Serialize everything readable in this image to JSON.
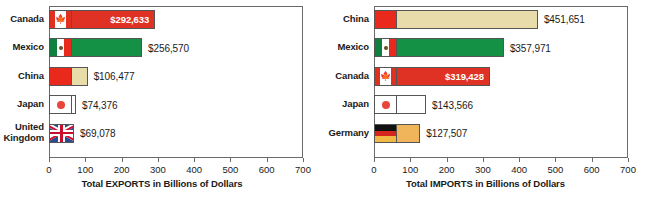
{
  "chart_data": [
    {
      "type": "bar",
      "orientation": "horizontal",
      "id": "exports",
      "title": "",
      "xlabel": "Total EXPORTS in Billions of Dollars",
      "ylabel": "",
      "xlim": [
        0,
        700
      ],
      "xticks": [
        0,
        100,
        200,
        300,
        400,
        500,
        600,
        700
      ],
      "grid": false,
      "legend": "none",
      "categories": [
        "Canada",
        "Mexico",
        "China",
        "Japan",
        "United\nKingdom"
      ],
      "values": [
        292.633,
        256.57,
        106.477,
        74.376,
        69.078
      ],
      "labels": [
        "$292,633",
        "$256,570",
        "$106,477",
        "$74,376",
        "$69,078"
      ],
      "label_position": [
        "inside",
        "outside",
        "outside",
        "outside",
        "outside"
      ]
    },
    {
      "type": "bar",
      "orientation": "horizontal",
      "id": "imports",
      "title": "",
      "xlabel": "Total IMPORTS in Billions of Dollars",
      "ylabel": "",
      "xlim": [
        0,
        700
      ],
      "xticks": [
        0,
        100,
        200,
        300,
        400,
        500,
        600,
        700
      ],
      "grid": false,
      "legend": "none",
      "categories": [
        "China",
        "Mexico",
        "Canada",
        "Japan",
        "Germany"
      ],
      "values": [
        451.651,
        357.971,
        319.428,
        143.566,
        127.507
      ],
      "labels": [
        "$451,651",
        "$357,971",
        "$319,428",
        "$143,566",
        "$127,507"
      ],
      "label_position": [
        "outside",
        "outside",
        "inside",
        "outside",
        "outside"
      ]
    }
  ],
  "exports": {
    "axis_title": "Total EXPORTS in Billions of Dollars",
    "ticks": [
      "0",
      "100",
      "200",
      "300",
      "400",
      "500",
      "600",
      "700"
    ],
    "rows": [
      {
        "country": "Canada",
        "line1": "Canada",
        "line2": "",
        "value": 292.633,
        "label": "$292,633",
        "inside": true,
        "flag": "ca",
        "fill": "#e03224"
      },
      {
        "country": "Mexico",
        "line1": "Mexico",
        "line2": "",
        "value": 256.57,
        "label": "$256,570",
        "inside": false,
        "flag": "mx",
        "fill": "#159145"
      },
      {
        "country": "China",
        "line1": "China",
        "line2": "",
        "value": 106.477,
        "label": "$106,477",
        "inside": false,
        "flag": "cn",
        "fill": "#e8dcab"
      },
      {
        "country": "Japan",
        "line1": "Japan",
        "line2": "",
        "value": 74.376,
        "label": "$74,376",
        "inside": false,
        "flag": "jp",
        "fill": "#ffffff"
      },
      {
        "country": "United Kingdom",
        "line1": "United",
        "line2": "Kingdom",
        "value": 69.078,
        "label": "$69,078",
        "inside": false,
        "flag": "uk",
        "fill": "#2a4b8d"
      }
    ]
  },
  "imports": {
    "axis_title": "Total IMPORTS in Billions of Dollars",
    "ticks": [
      "0",
      "100",
      "200",
      "300",
      "400",
      "500",
      "600",
      "700"
    ],
    "rows": [
      {
        "country": "China",
        "line1": "China",
        "line2": "",
        "value": 451.651,
        "label": "$451,651",
        "inside": false,
        "flag": "cn",
        "fill": "#e8dcab"
      },
      {
        "country": "Mexico",
        "line1": "Mexico",
        "line2": "",
        "value": 357.971,
        "label": "$357,971",
        "inside": false,
        "flag": "mx",
        "fill": "#159145"
      },
      {
        "country": "Canada",
        "line1": "Canada",
        "line2": "",
        "value": 319.428,
        "label": "$319,428",
        "inside": true,
        "flag": "ca",
        "fill": "#e03224"
      },
      {
        "country": "Japan",
        "line1": "Japan",
        "line2": "",
        "value": 143.566,
        "label": "$143,566",
        "inside": false,
        "flag": "jp",
        "fill": "#ffffff"
      },
      {
        "country": "Germany",
        "line1": "Germany",
        "line2": "",
        "value": 127.507,
        "label": "$127,507",
        "inside": false,
        "flag": "de",
        "fill": "#f0b45a"
      }
    ]
  },
  "colors": {
    "canada_red": "#e03224",
    "mexico_green": "#159145",
    "china_tan": "#e8dcab",
    "japan_white": "#ffffff",
    "uk_blue": "#2a4b8d",
    "germany_gold": "#f0b45a",
    "axis": "#6b6b6b",
    "text": "#1a1a1a"
  }
}
